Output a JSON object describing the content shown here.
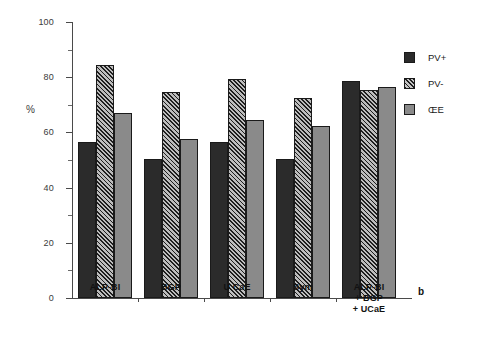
{
  "chart_data": {
    "type": "bar",
    "title": "",
    "subtitle": "",
    "xlabel": "",
    "ylabel": "%",
    "ylim": [
      0,
      100
    ],
    "ytick_major": [
      0,
      20,
      40,
      60,
      80,
      100
    ],
    "ytick_minor": [
      10,
      30,
      50,
      70,
      90
    ],
    "grid": false,
    "legend_position": "right",
    "panel_label": "b",
    "categories": [
      "ALP-BI",
      "BGP",
      "U CaE",
      "Sym",
      "ALP-BI\n+ BGP\n+ UCaE"
    ],
    "category_lines": [
      [
        "ALP-BI"
      ],
      [
        "BGP"
      ],
      [
        "U CaE"
      ],
      [
        "Sym"
      ],
      [
        "ALP-BI",
        "+ BGP",
        "+ UCaE"
      ]
    ],
    "series": [
      {
        "name": "PV+",
        "color": "#2b2b2b",
        "pattern": "solid",
        "values": [
          56.5,
          50.5,
          56.5,
          50.5,
          78.5
        ]
      },
      {
        "name": "PV-",
        "color": "#6e6e6e",
        "pattern": "hatch",
        "values": [
          84.5,
          74.5,
          79.5,
          72.5,
          75.5
        ]
      },
      {
        "name": "ŒE",
        "color": "#8a8a8a",
        "pattern": "solid",
        "values": [
          67.0,
          57.5,
          64.5,
          62.5,
          76.5
        ]
      }
    ]
  },
  "legend": {
    "items": [
      {
        "label": "PV+"
      },
      {
        "label": "PV-"
      },
      {
        "label": "ŒE"
      }
    ]
  },
  "axis": {
    "y_title": "%",
    "y_labels": [
      "100",
      "80",
      "60",
      "40",
      "20",
      "0"
    ]
  },
  "annotations": {
    "panel_letter": "b"
  }
}
